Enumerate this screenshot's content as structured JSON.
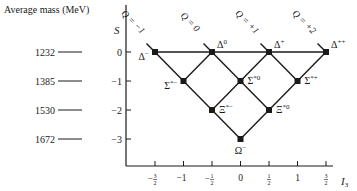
{
  "title": "Average mass (MeV)",
  "axes": {
    "y_label": "S",
    "x_label": "I",
    "x_label_sub": "3",
    "y_ticks": [
      {
        "label": "0",
        "value": 0
      },
      {
        "label": "−1",
        "value": -1
      },
      {
        "label": "−2",
        "value": -2
      },
      {
        "label": "−3",
        "value": -3
      }
    ],
    "x_ticks": [
      {
        "num": "3",
        "den": "2",
        "neg": true,
        "value": -1.5
      },
      {
        "text": "−1",
        "value": -1
      },
      {
        "num": "1",
        "den": "2",
        "neg": true,
        "value": -0.5
      },
      {
        "text": "0",
        "value": 0
      },
      {
        "num": "1",
        "den": "2",
        "neg": false,
        "value": 0.5
      },
      {
        "text": "1",
        "value": 1
      },
      {
        "num": "3",
        "den": "2",
        "neg": false,
        "value": 1.5
      }
    ]
  },
  "masses": [
    {
      "value": "1232",
      "S": 0
    },
    {
      "value": "1385",
      "S": -1
    },
    {
      "value": "1530",
      "S": -2
    },
    {
      "value": "1672",
      "S": -3
    }
  ],
  "charge_lines": [
    {
      "label": "Q = −1",
      "I3_at_S0": -1.5
    },
    {
      "label": "Q = 0",
      "I3_at_S0": -0.5
    },
    {
      "label": "Q = +1",
      "I3_at_S0": 0.5
    },
    {
      "label": "Q = +2",
      "I3_at_S0": 1.5
    }
  ],
  "particles": [
    {
      "name": "Δ",
      "sup": "−",
      "I3": -1.5,
      "S": 0,
      "label_side": "left"
    },
    {
      "name": "Δ",
      "sup": "0",
      "I3": -0.5,
      "S": 0,
      "label_side": "upper-right"
    },
    {
      "name": "Δ",
      "sup": "+",
      "I3": 0.5,
      "S": 0,
      "label_side": "upper-right"
    },
    {
      "name": "Δ",
      "sup": "++",
      "I3": 1.5,
      "S": 0,
      "label_side": "upper-right"
    },
    {
      "name": "Σ",
      "sup": "*−",
      "I3": -1,
      "S": -1,
      "label_side": "left"
    },
    {
      "name": "Σ",
      "sup": "*0",
      "I3": 0,
      "S": -1,
      "label_side": "right"
    },
    {
      "name": "Σ",
      "sup": "*+",
      "I3": 1,
      "S": -1,
      "label_side": "right"
    },
    {
      "name": "Ξ",
      "sup": "*−",
      "I3": -0.5,
      "S": -2,
      "label_side": "right"
    },
    {
      "name": "Ξ",
      "sup": "*0",
      "I3": 0.5,
      "S": -2,
      "label_side": "right"
    },
    {
      "name": "Ω",
      "sup": "−",
      "I3": 0,
      "S": -3,
      "label_side": "below"
    }
  ],
  "colors": {
    "ink": "#1a1a1a",
    "background": "#ffffff"
  }
}
